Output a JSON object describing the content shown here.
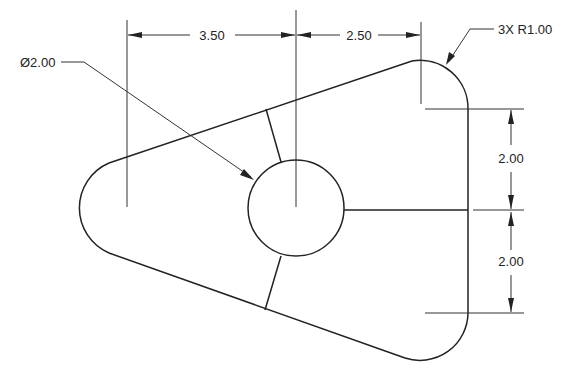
{
  "drawing": {
    "type": "2D mechanical part drawing",
    "dimensions": {
      "horizontal_left": "3.50",
      "horizontal_right": "2.50",
      "vertical_upper": "2.00",
      "vertical_lower": "2.00"
    },
    "callouts": {
      "hole_diameter": "Ø2.00",
      "corner_radius": "3X R1.00"
    },
    "colors": {
      "line": "#222222",
      "background": "#ffffff"
    }
  }
}
